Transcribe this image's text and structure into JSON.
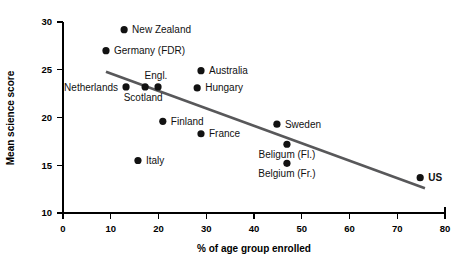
{
  "chart_data": {
    "type": "scatter",
    "title": "",
    "xlabel": "% of age group enrolled",
    "ylabel": "Mean science  score",
    "xlim": [
      0,
      80
    ],
    "ylim": [
      10,
      30
    ],
    "xticks": [
      0,
      10,
      20,
      30,
      40,
      50,
      60,
      70,
      80
    ],
    "yticks": [
      10,
      15,
      20,
      25,
      30
    ],
    "grid": false,
    "legend": "none",
    "marker_color": "#121212",
    "trendline_color": "#58585a",
    "axis_color": "#000000",
    "background_color": "#ffffff",
    "points": [
      {
        "label": "New Zealand",
        "x": 12.8,
        "y": 29.2,
        "label_pos": "right",
        "bold": false
      },
      {
        "label": "Germany (FDR)",
        "x": 9.0,
        "y": 27.0,
        "label_pos": "right",
        "bold": false
      },
      {
        "label": "Netherlands",
        "x": 13.2,
        "y": 23.2,
        "label_pos": "left",
        "bold": false
      },
      {
        "label": "Scotland",
        "x": 17.2,
        "y": 23.2,
        "label_pos": "below-left",
        "bold": false
      },
      {
        "label": "Engl.",
        "x": 19.9,
        "y": 23.2,
        "label_pos": "above",
        "bold": false
      },
      {
        "label": "Australia",
        "x": 28.9,
        "y": 24.9,
        "label_pos": "right",
        "bold": false
      },
      {
        "label": "Hungary",
        "x": 28.1,
        "y": 23.1,
        "label_pos": "right",
        "bold": false
      },
      {
        "label": "Finland",
        "x": 20.9,
        "y": 19.6,
        "label_pos": "right",
        "bold": false
      },
      {
        "label": "France",
        "x": 28.9,
        "y": 18.3,
        "label_pos": "right",
        "bold": false
      },
      {
        "label": "Italy",
        "x": 15.7,
        "y": 15.5,
        "label_pos": "right",
        "bold": false
      },
      {
        "label": "Sweden",
        "x": 44.8,
        "y": 19.3,
        "label_pos": "right",
        "bold": false
      },
      {
        "label": "Beligum (Fl.)",
        "x": 46.9,
        "y": 17.2,
        "label_pos": "below-center",
        "bold": false
      },
      {
        "label": "Belgium (Fr.)",
        "x": 46.9,
        "y": 15.2,
        "label_pos": "below-center",
        "bold": false
      },
      {
        "label": "US",
        "x": 74.8,
        "y": 13.7,
        "label_pos": "right",
        "bold": true
      }
    ],
    "trendline": {
      "x_start": 9.0,
      "y_start": 24.8,
      "x_end": 75.8,
      "y_end": 12.6,
      "description": "negative linear trend line"
    }
  }
}
